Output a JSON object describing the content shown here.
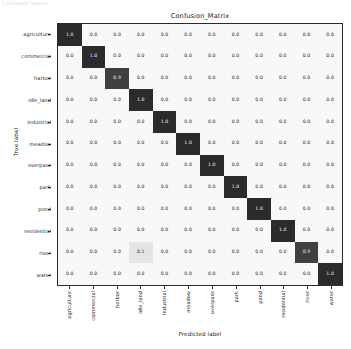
{
  "figure": {
    "title": "Confusion_Matrix",
    "xlabel": "Predicted label",
    "ylabel": "True label",
    "top_clipped_text": "Confusion matrix"
  },
  "colors": {
    "high": "#2b2b2b",
    "low": "#f8f8f8",
    "text_on_high": "#f2f2f2",
    "text_on_low": "#1f1f1f",
    "axis": "#2b2b2b",
    "background": "#ffffff"
  },
  "chart_data": {
    "type": "heatmap",
    "title": "Confusion_Matrix",
    "xlabel": "Predicted label",
    "ylabel": "True label",
    "grid": false,
    "legend": "none",
    "colormap": "Greys",
    "zlim": [
      0.0,
      1.0
    ],
    "categories": [
      "agriculture",
      "commercial",
      "harbor",
      "idle_land",
      "industrial",
      "meadow",
      "overpass",
      "park",
      "pond",
      "residential",
      "river",
      "water"
    ],
    "x_tick_labels": [
      "agriculture",
      "commercial",
      "harbor",
      "idle_land",
      "industrial",
      "meadow",
      "overpass",
      "park",
      "pond",
      "residential",
      "river",
      "water"
    ],
    "y_tick_labels": [
      "agriculture",
      "commercial",
      "harbor",
      "idle_land",
      "industrial",
      "meadow",
      "overpass",
      "park",
      "pond",
      "residential",
      "river",
      "water"
    ],
    "value_format": "0.1",
    "matrix": [
      [
        1.0,
        0.0,
        0.0,
        0.0,
        0.0,
        0.0,
        0.0,
        0.0,
        0.0,
        0.0,
        0.0,
        0.0
      ],
      [
        0.0,
        1.0,
        0.0,
        0.0,
        0.0,
        0.0,
        0.0,
        0.0,
        0.0,
        0.0,
        0.0,
        0.0
      ],
      [
        0.0,
        0.0,
        0.9,
        0.0,
        0.0,
        0.0,
        0.0,
        0.0,
        0.0,
        0.0,
        0.0,
        0.0
      ],
      [
        0.0,
        0.0,
        0.0,
        1.0,
        0.0,
        0.0,
        0.0,
        0.0,
        0.0,
        0.0,
        0.0,
        0.0
      ],
      [
        0.0,
        0.0,
        0.0,
        0.0,
        1.0,
        0.0,
        0.0,
        0.0,
        0.0,
        0.0,
        0.0,
        0.0
      ],
      [
        0.0,
        0.0,
        0.0,
        0.0,
        0.0,
        1.0,
        0.0,
        0.0,
        0.0,
        0.0,
        0.0,
        0.0
      ],
      [
        0.0,
        0.0,
        0.0,
        0.0,
        0.0,
        0.0,
        1.0,
        0.0,
        0.0,
        0.0,
        0.0,
        0.0
      ],
      [
        0.0,
        0.0,
        0.0,
        0.0,
        0.0,
        0.0,
        0.0,
        1.0,
        0.0,
        0.0,
        0.0,
        0.0
      ],
      [
        0.0,
        0.0,
        0.0,
        0.0,
        0.0,
        0.0,
        0.0,
        0.0,
        1.0,
        0.0,
        0.0,
        0.0
      ],
      [
        0.0,
        0.0,
        0.0,
        0.0,
        0.0,
        0.0,
        0.0,
        0.0,
        0.0,
        1.0,
        0.0,
        0.0
      ],
      [
        0.0,
        0.0,
        0.0,
        0.1,
        0.0,
        0.0,
        0.0,
        0.0,
        0.0,
        0.0,
        0.9,
        0.0
      ],
      [
        0.0,
        0.0,
        0.0,
        0.0,
        0.0,
        0.0,
        0.0,
        0.0,
        0.0,
        0.0,
        0.0,
        1.0
      ]
    ],
    "cell_labels": [
      [
        "1.0",
        "0.0",
        "0.0",
        "0.0",
        "0.0",
        "0.0",
        "0.0",
        "0.0",
        "0.0",
        "0.0",
        "0.0",
        "0.0"
      ],
      [
        "0.0",
        "1.0",
        "0.0",
        "0.0",
        "0.0",
        "0.0",
        "0.0",
        "0.0",
        "0.0",
        "0.0",
        "0.0",
        "0.0"
      ],
      [
        "0.0",
        "0.0",
        "0.9",
        "0.0",
        "0.0",
        "0.0",
        "0.0",
        "0.0",
        "0.0",
        "0.0",
        "0.0",
        "0.0"
      ],
      [
        "0.0",
        "0.0",
        "0.0",
        "1.0",
        "0.0",
        "0.0",
        "0.0",
        "0.0",
        "0.0",
        "0.0",
        "0.0",
        "0.0"
      ],
      [
        "0.0",
        "0.0",
        "0.0",
        "0.0",
        "1.0",
        "0.0",
        "0.0",
        "0.0",
        "0.0",
        "0.0",
        "0.0",
        "0.0"
      ],
      [
        "0.0",
        "0.0",
        "0.0",
        "0.0",
        "0.0",
        "1.0",
        "0.0",
        "0.0",
        "0.0",
        "0.0",
        "0.0",
        "0.0"
      ],
      [
        "0.0",
        "0.0",
        "0.0",
        "0.0",
        "0.0",
        "0.0",
        "1.0",
        "0.0",
        "0.0",
        "0.0",
        "0.0",
        "0.0"
      ],
      [
        "0.0",
        "0.0",
        "0.0",
        "0.0",
        "0.0",
        "0.0",
        "0.0",
        "1.0",
        "0.0",
        "0.0",
        "0.0",
        "0.0"
      ],
      [
        "0.0",
        "0.0",
        "0.0",
        "0.0",
        "0.0",
        "0.0",
        "0.0",
        "0.0",
        "1.0",
        "0.0",
        "0.0",
        "0.0"
      ],
      [
        "0.0",
        "0.0",
        "0.0",
        "0.0",
        "0.0",
        "0.0",
        "0.0",
        "0.0",
        "0.0",
        "1.0",
        "0.0",
        "0.0"
      ],
      [
        "0.0",
        "0.0",
        "0.0",
        "0.1",
        "0.0",
        "0.0",
        "0.0",
        "0.0",
        "0.0",
        "0.0",
        "0.9",
        "0.0"
      ],
      [
        "0.0",
        "0.0",
        "0.0",
        "0.0",
        "0.0",
        "0.0",
        "0.0",
        "0.0",
        "0.0",
        "0.0",
        "0.0",
        "1.0"
      ]
    ]
  }
}
